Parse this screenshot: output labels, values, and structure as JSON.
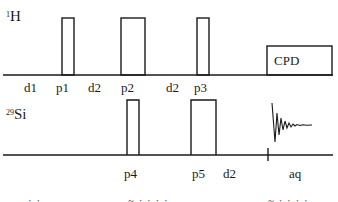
{
  "channels": {
    "h": {
      "isotope": "1",
      "symbol": "H"
    },
    "si": {
      "isotope": "29",
      "symbol": "Si"
    }
  },
  "h_labels": [
    "d1",
    "p1",
    "d2",
    "p2",
    "d2",
    "p3"
  ],
  "cpd_label": "CPD",
  "si_labels": [
    "p4",
    "p5",
    "d2",
    "aq"
  ],
  "bottom_fragments": [
    "· ·",
    "~ · · · ·",
    "~ · · · ·"
  ],
  "colors": {
    "line": "#1a1a1a",
    "background": "#ffffff"
  }
}
